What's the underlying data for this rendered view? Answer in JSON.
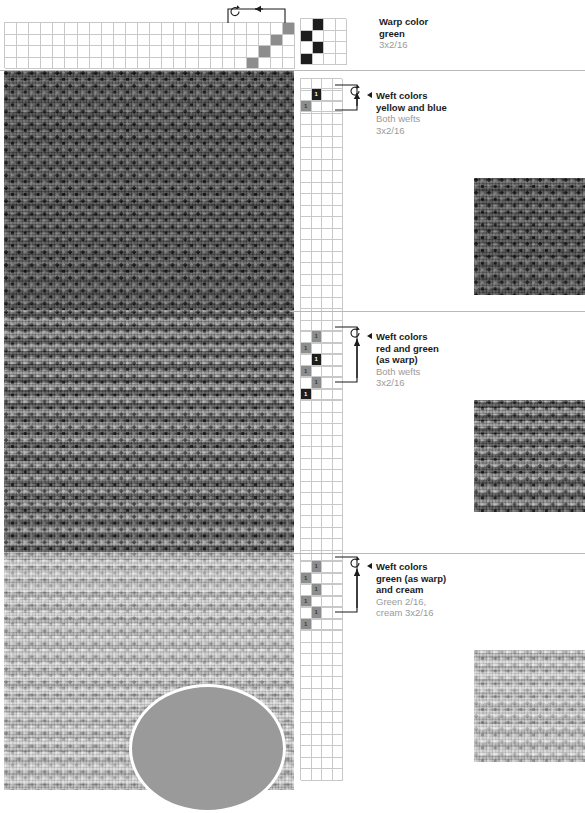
{
  "document": {
    "type": "weaving-draft-diagram",
    "title_visible": false
  },
  "threading": {
    "name": "threading-draft",
    "columns": 24,
    "rows": 4,
    "repeat_columns": 4,
    "fill_color": "#8d8d8d",
    "empty_color": "#ffffff",
    "grid_line_color": "#c8c8c8",
    "repeat_marker": "rotate-repeat-arrow",
    "pattern_note": "4-end straight draw diagonal, repeat marked at right",
    "cells": [
      {
        "row": 0,
        "col": 23,
        "fill": "gray"
      },
      {
        "row": 1,
        "col": 22,
        "fill": "gray"
      },
      {
        "row": 2,
        "col": 21,
        "fill": "gray"
      },
      {
        "row": 3,
        "col": 20,
        "fill": "gray"
      }
    ]
  },
  "tieup": {
    "name": "tie-up",
    "rows": 4,
    "columns": 4,
    "fill_color": "#1d1d1d",
    "cells": [
      {
        "row": 0,
        "col": 1,
        "fill": "black"
      },
      {
        "row": 1,
        "col": 0,
        "fill": "black"
      },
      {
        "row": 2,
        "col": 1,
        "fill": "black"
      },
      {
        "row": 3,
        "col": 0,
        "fill": "black"
      }
    ]
  },
  "warp_legend": {
    "name": "warp-color-legend",
    "line1": "Warp color",
    "line2": "green",
    "line3": "3x2/16"
  },
  "sections": [
    {
      "id": "section-1",
      "caption": {
        "marker": "left-triangle",
        "line1": "Weft colors",
        "line2": "yellow and blue",
        "line3": "Both wefts",
        "line4": "3x2/16"
      },
      "treadling": {
        "name": "treadling-draft-1",
        "rows": 2,
        "repeat_marker": "rotate-repeat-arrow",
        "cells": [
          {
            "row": 0,
            "col": 1,
            "fill": "black",
            "label": "1"
          },
          {
            "row": 1,
            "col": 0,
            "fill": "gray",
            "label": "1"
          }
        ]
      },
      "fabric_tone": "dark"
    },
    {
      "id": "section-2",
      "caption": {
        "marker": "left-triangle",
        "line1": "Weft colors",
        "line2": "red and green",
        "line3": "(as warp)",
        "line4": "Both wefts",
        "line5": "3x2/16"
      },
      "treadling": {
        "name": "treadling-draft-2",
        "rows": 6,
        "repeat_marker": "rotate-repeat-arrow",
        "cells": [
          {
            "row": 0,
            "col": 1,
            "fill": "gray",
            "label": "1"
          },
          {
            "row": 1,
            "col": 0,
            "fill": "gray",
            "label": "1"
          },
          {
            "row": 2,
            "col": 1,
            "fill": "black",
            "label": "1"
          },
          {
            "row": 3,
            "col": 0,
            "fill": "gray",
            "label": "1"
          },
          {
            "row": 4,
            "col": 1,
            "fill": "gray",
            "label": "1"
          },
          {
            "row": 5,
            "col": 0,
            "fill": "black",
            "label": "1"
          }
        ]
      },
      "fabric_tone": "mid"
    },
    {
      "id": "section-3",
      "caption": {
        "marker": "left-triangle",
        "line1": "Weft colors",
        "line2": "green (as warp)",
        "line3": "and cream",
        "line4": "Green 2/16,",
        "line5": "cream 3x2/16"
      },
      "treadling": {
        "name": "treadling-draft-3",
        "rows": 6,
        "repeat_marker": "rotate-repeat-arrow",
        "cells": [
          {
            "row": 0,
            "col": 1,
            "fill": "gray",
            "label": "1"
          },
          {
            "row": 1,
            "col": 0,
            "fill": "gray",
            "label": "1"
          },
          {
            "row": 2,
            "col": 1,
            "fill": "gray",
            "label": "1"
          },
          {
            "row": 3,
            "col": 0,
            "fill": "gray",
            "label": "1"
          },
          {
            "row": 4,
            "col": 1,
            "fill": "gray",
            "label": "1"
          },
          {
            "row": 5,
            "col": 0,
            "fill": "gray",
            "label": "1"
          }
        ]
      },
      "fabric_tone": "light"
    }
  ],
  "fabric_samples": {
    "main_column": [
      {
        "name": "fabric-sample-main-1",
        "tone": "dark"
      },
      {
        "name": "fabric-sample-main-2",
        "tone": "mid"
      },
      {
        "name": "fabric-sample-main-3",
        "tone": "light"
      }
    ],
    "right_column": [
      {
        "name": "fabric-sample-right-1",
        "tone": "dark"
      },
      {
        "name": "fabric-sample-right-2",
        "tone": "mid"
      },
      {
        "name": "fabric-sample-right-3",
        "tone": "light"
      }
    ],
    "magnifier": {
      "name": "fabric-detail-magnifier",
      "tone": "light",
      "shape": "circle"
    }
  },
  "colors": {
    "fill_gray": "#8d8d8d",
    "fill_black": "#1d1d1d",
    "grid_line": "#c8c8c8",
    "rule": "#b9b9b9",
    "text_dark": "#1b1b1b",
    "text_muted": "#9a9a9a"
  }
}
